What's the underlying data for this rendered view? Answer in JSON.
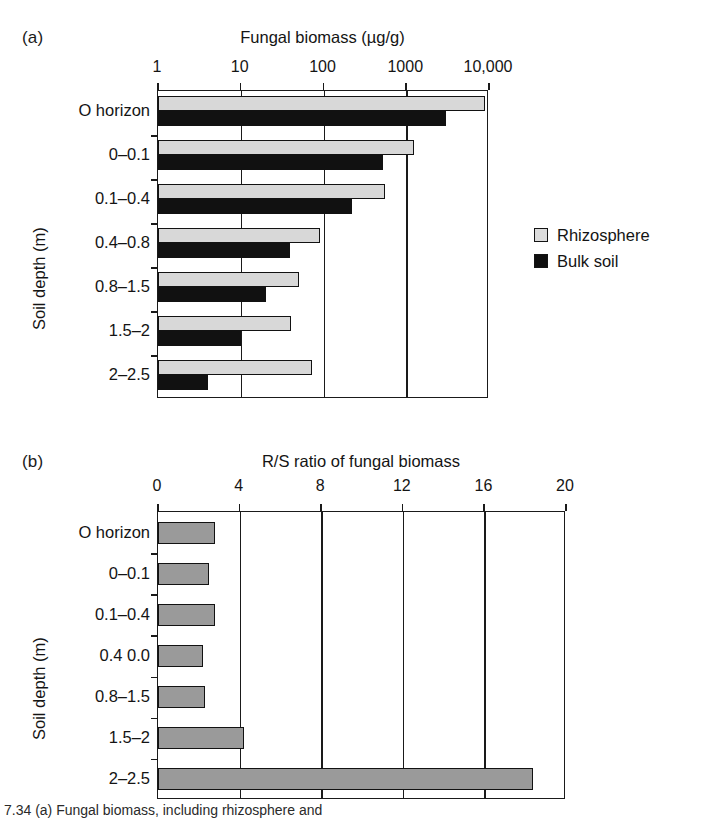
{
  "figure": {
    "background": "#ffffff",
    "ink_color": "#1a1a1a",
    "caption_fragment": "7.34   (a) Fungal biomass, including rhizosphere and"
  },
  "panel_a": {
    "letter": "(a)",
    "axis_title": "Fungal biomass (µg/g)",
    "ylabel": "Soil depth (m)",
    "xticks": [
      "1",
      "10",
      "100",
      "1000",
      "10,000"
    ],
    "categories": [
      "O horizon",
      "0–0.1",
      "0.1–0.4",
      "0.4–0.8",
      "0.8–1.5",
      "1.5–2",
      "2–2.5"
    ],
    "legend": [
      {
        "label": "Rhizosphere",
        "color": "#dcdcdc"
      },
      {
        "label": "Bulk soil",
        "color": "#0f0f0f"
      }
    ]
  },
  "panel_b": {
    "letter": "(b)",
    "axis_title": "R/S ratio of fungal biomass",
    "ylabel": "Soil depth (m)",
    "xticks": [
      "0",
      "4",
      "8",
      "12",
      "16",
      "20"
    ],
    "categories": [
      "O horizon",
      "0–0.1",
      "0.1–0.4",
      "0.4  0.0",
      "0.8–1.5",
      "1.5–2",
      "2–2.5"
    ],
    "bar_color": "#9a9a9a"
  },
  "chart_data": [
    {
      "type": "bar",
      "orientation": "horizontal",
      "panel": "a",
      "title": "Fungal biomass (µg/g)",
      "xlabel": "Fungal biomass (µg/g)",
      "ylabel": "Soil depth (m)",
      "xscale": "log",
      "xlim": [
        1,
        10000
      ],
      "xticks": [
        1,
        10,
        100,
        1000,
        10000
      ],
      "xticklabels": [
        "1",
        "10",
        "100",
        "1000",
        "10,000"
      ],
      "grid": true,
      "legend_position": "right",
      "categories": [
        "O horizon",
        "0–0.1",
        "0.1–0.4",
        "0.4–0.8",
        "0.8–1.5",
        "1.5–2",
        "2–2.5"
      ],
      "series": [
        {
          "name": "Rhizosphere",
          "color": "#dcdcdc",
          "values": [
            9000,
            1250,
            560,
            90,
            50,
            40,
            73
          ]
        },
        {
          "name": "Bulk soil",
          "color": "#0f0f0f",
          "values": [
            3000,
            520,
            220,
            39,
            20,
            10,
            4
          ]
        }
      ]
    },
    {
      "type": "bar",
      "orientation": "horizontal",
      "panel": "b",
      "title": "R/S ratio of fungal biomass",
      "xlabel": "R/S ratio of fungal biomass",
      "ylabel": "Soil depth (m)",
      "xscale": "linear",
      "xlim": [
        0,
        20
      ],
      "xticks": [
        0,
        4,
        8,
        12,
        16,
        20
      ],
      "xticklabels": [
        "0",
        "4",
        "8",
        "12",
        "16",
        "20"
      ],
      "grid": true,
      "legend_position": "none",
      "categories": [
        "O horizon",
        "0–0.1",
        "0.1–0.4",
        "0.4  0.0",
        "0.8–1.5",
        "1.5–2",
        "2–2.5"
      ],
      "series": [
        {
          "name": "R/S ratio",
          "color": "#9a9a9a",
          "values": [
            2.8,
            2.5,
            2.8,
            2.2,
            2.3,
            4.2,
            18.4
          ]
        }
      ]
    }
  ]
}
